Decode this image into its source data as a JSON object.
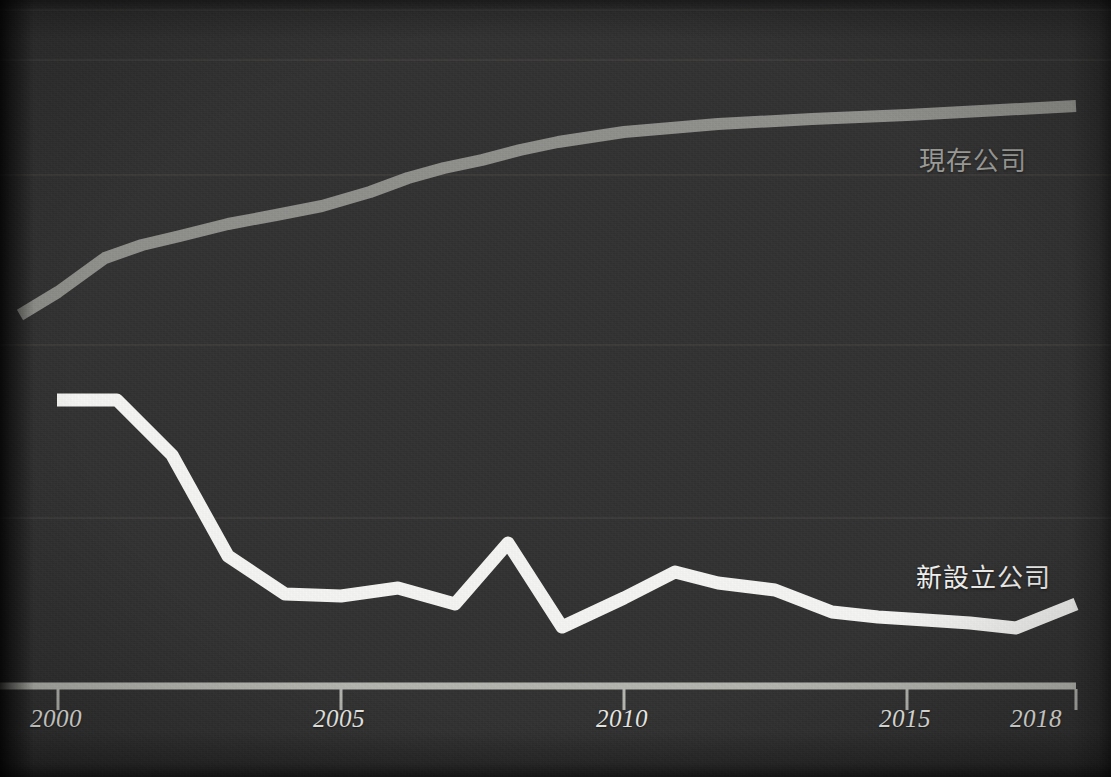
{
  "figure": {
    "background_color": "#333232",
    "axis_color": "#b5b5b0",
    "gridline_color": "#3c3b3a"
  },
  "axis": {
    "tick_labels": [
      "2000",
      "2005",
      "2010",
      "2015",
      "2018"
    ],
    "tick_values": [
      2000,
      2005,
      2010,
      2015,
      2018
    ],
    "tick_x_px": [
      58,
      341,
      624,
      907,
      1076
    ],
    "baseline_y_px": 686
  },
  "labels": {
    "existing": "現存公司",
    "newly": "新設立公司"
  },
  "gridlines_y_px": [
    10,
    60,
    175,
    345,
    518
  ],
  "chart_data": {
    "type": "line",
    "title": "",
    "subtitle": "",
    "xlabel": "",
    "ylabel": "",
    "grid": true,
    "legend_position": "inline-right",
    "xlim": [
      1999.3,
      2018.3
    ],
    "xtick_labels": [
      "2000",
      "2005",
      "2010",
      "2015",
      "2018"
    ],
    "x": [
      2000,
      2001,
      2002,
      2003,
      2004,
      2005,
      2006,
      2007,
      2008,
      2009,
      2010,
      2011,
      2012,
      2013,
      2014,
      2015,
      2016,
      2017,
      2018
    ],
    "series": [
      {
        "name": "現存公司",
        "color": "#8f8f8b",
        "label_color": "#9b9b97",
        "values": [
          40,
          50,
          57,
          62,
          65,
          68,
          70,
          75,
          78,
          80,
          81,
          82,
          83,
          85,
          86,
          86,
          87,
          88,
          90
        ],
        "pixel_points": [
          [
            20,
            315
          ],
          [
            58,
            292
          ],
          [
            105,
            258
          ],
          [
            142,
            245
          ],
          [
            180,
            236
          ],
          [
            228,
            224
          ],
          [
            276,
            215
          ],
          [
            322,
            206
          ],
          [
            370,
            192
          ],
          [
            408,
            178
          ],
          [
            444,
            168
          ],
          [
            482,
            160
          ],
          [
            520,
            150
          ],
          [
            558,
            142
          ],
          [
            624,
            132
          ],
          [
            718,
            124
          ],
          [
            812,
            119
          ],
          [
            907,
            115
          ],
          [
            1000,
            110
          ],
          [
            1076,
            106
          ]
        ]
      },
      {
        "name": "新設立公司",
        "color": "#f5f5f3",
        "label_color": "#f2f2f0",
        "values": [
          62,
          62,
          55,
          40,
          33,
          33,
          34,
          32,
          42,
          24,
          29,
          33,
          31,
          30,
          26,
          25,
          25,
          24,
          27
        ],
        "pixel_points": [
          [
            57,
            400
          ],
          [
            117,
            400
          ],
          [
            172,
            455
          ],
          [
            228,
            556
          ],
          [
            285,
            594
          ],
          [
            341,
            596
          ],
          [
            398,
            588
          ],
          [
            455,
            604
          ],
          [
            508,
            543
          ],
          [
            562,
            627
          ],
          [
            624,
            598
          ],
          [
            675,
            572
          ],
          [
            718,
            583
          ],
          [
            775,
            590
          ],
          [
            832,
            612
          ],
          [
            878,
            617
          ],
          [
            925,
            620
          ],
          [
            970,
            623
          ],
          [
            1016,
            628
          ],
          [
            1076,
            604
          ]
        ]
      }
    ]
  }
}
